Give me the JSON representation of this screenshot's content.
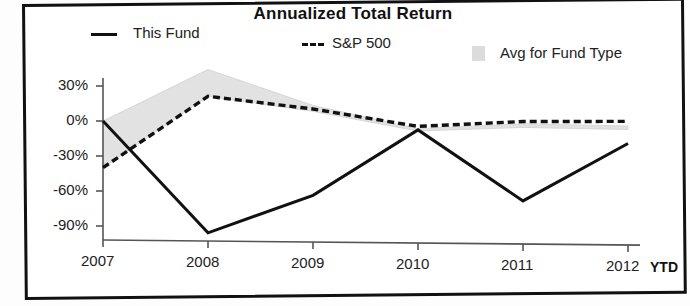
{
  "chart_data": {
    "type": "line",
    "title": "Annualized Total Return",
    "xlabel": "",
    "ylabel": "",
    "x": [
      "2007",
      "2008",
      "2009",
      "2010",
      "2011",
      "2012"
    ],
    "x_suffix": "YTD",
    "ylim": [
      -105,
      48
    ],
    "yticks": [
      30,
      0,
      -30,
      -60,
      -90
    ],
    "ytick_labels": [
      "30%",
      "0%",
      "-30%",
      "-60%",
      "-90%"
    ],
    "grid": false,
    "legend_position": "top",
    "series": [
      {
        "name": "This Fund",
        "style": "solid",
        "color": "#111111",
        "values": [
          0,
          -95,
          -62,
          -5,
          -65,
          -15
        ]
      },
      {
        "name": "S&P 500",
        "style": "dashed",
        "color": "#111111",
        "values": [
          -40,
          22,
          12,
          -2,
          3,
          4
        ]
      },
      {
        "name": "Avg for Fund Type",
        "style": "band",
        "color": "#dcdcdc",
        "values": [
          0,
          45,
          15,
          -4,
          1,
          0
        ],
        "values_lower": [
          -40,
          22,
          10,
          -6,
          -2,
          -3
        ]
      }
    ]
  },
  "legend": {
    "fund_label": "This Fund",
    "sp_label": "S&P 500",
    "avg_label": "Avg for Fund Type",
    "fund_swatch": "solid-line-swatch",
    "sp_swatch": "dashed-line-swatch",
    "avg_swatch": "gray-square-swatch"
  },
  "colors": {
    "line": "#111111",
    "band": "#dcdcdc",
    "axis": "#555555",
    "frame": "#111111"
  }
}
